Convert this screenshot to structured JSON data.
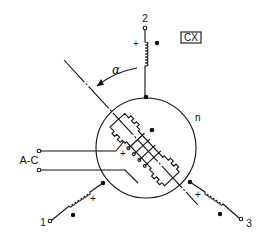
{
  "diagram": {
    "title_box": "CX",
    "angle_label": "α",
    "rotor_input_label": "A-C",
    "terminals": [
      {
        "id": "1",
        "label": "1"
      },
      {
        "id": "2",
        "label": "2"
      },
      {
        "id": "3",
        "label": "3"
      }
    ],
    "neutral_label": "n",
    "polarity_marks": {
      "plus": "+",
      "dot": "●"
    }
  },
  "colors": {
    "ink": "#111111",
    "background": "#ffffff"
  }
}
